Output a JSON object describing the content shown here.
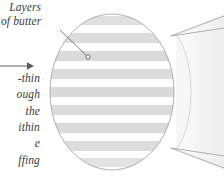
{
  "figure": {
    "background_color": "#ffffff"
  },
  "callout": {
    "label_line1": "Layers",
    "label_line2": "of butter",
    "leader_from_x": 62,
    "leader_from_y": 31,
    "leader_to_x": 88,
    "leader_to_y": 57,
    "marker_shape": "small-circle"
  },
  "body_text": {
    "line1": "-thin",
    "line2": "ough",
    "line3": "the",
    "line4": "ithin",
    "line5": "e",
    "line6": "ffing"
  },
  "arrow": {
    "name": "pointer-arrow",
    "direction": "right",
    "x1": 0,
    "y1": 66,
    "x2": 30,
    "y2": 66
  },
  "cross_section": {
    "shape": "circle",
    "center_x": 112,
    "center_y": 92,
    "radius_x": 62,
    "radius_y": 78,
    "outline_color": "#9a9a9a",
    "band_color": "#dcdcdc",
    "gap_color": "#ffffff",
    "band_count": 9,
    "bands": [
      {
        "y": 16,
        "height": 9
      },
      {
        "y": 33,
        "height": 10
      },
      {
        "y": 51,
        "height": 10
      },
      {
        "y": 69,
        "height": 10
      },
      {
        "y": 87,
        "height": 10
      },
      {
        "y": 105,
        "height": 10
      },
      {
        "y": 123,
        "height": 10
      },
      {
        "y": 141,
        "height": 10
      },
      {
        "y": 158,
        "height": 9
      }
    ]
  },
  "cylinder": {
    "name": "magnified-source-cylinder",
    "edge_color": "#b0b0b0",
    "body_color": "#f5f5f5",
    "tangent_top_y": 34,
    "tangent_bottom_y": 150
  },
  "colors": {
    "text": "#3b3b3b",
    "line": "#6f6f6f",
    "outline": "#9a9a9a",
    "band": "#dcdcdc",
    "faint": "#e8e8e8"
  }
}
